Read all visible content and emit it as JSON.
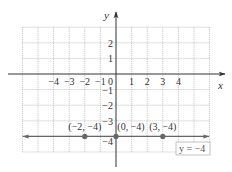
{
  "chart_data": {
    "type": "line",
    "title": "",
    "xlabel": "x",
    "ylabel": "y",
    "xlim": [
      -6,
      6
    ],
    "ylim": [
      -5,
      3
    ],
    "grid": true,
    "x_ticks": [
      "-4",
      "-3",
      "-2",
      "-1",
      "0",
      "1",
      "2",
      "3",
      "4"
    ],
    "y_ticks": [
      "2",
      "1",
      "-1",
      "-2",
      "-3",
      "-4"
    ],
    "series": [
      {
        "name": "y = -4",
        "type": "horizontal-line",
        "y": -4,
        "points": [
          {
            "x": -2,
            "y": -4,
            "label": "(−2, −4)"
          },
          {
            "x": 0,
            "y": -4,
            "label": "(0, −4)"
          },
          {
            "x": 3,
            "y": -4,
            "label": "(3, −4)"
          }
        ]
      }
    ],
    "annotations": [
      {
        "text": "y = −4",
        "boxed": true,
        "position": "bottom-right"
      }
    ]
  },
  "labels": {
    "x_axis": "x",
    "y_axis": "y",
    "origin": "0",
    "equation": "y = −4",
    "xticks": [
      {
        "v": -4,
        "t": "−4"
      },
      {
        "v": -3,
        "t": "−3"
      },
      {
        "v": -2,
        "t": "−2"
      },
      {
        "v": -1,
        "t": "−1"
      },
      {
        "v": 1,
        "t": "1"
      },
      {
        "v": 2,
        "t": "2"
      },
      {
        "v": 3,
        "t": "3"
      },
      {
        "v": 4,
        "t": "4"
      }
    ],
    "yticks": [
      {
        "v": 2,
        "t": "2"
      },
      {
        "v": 1,
        "t": "1"
      },
      {
        "v": -1,
        "t": "−1"
      },
      {
        "v": -2,
        "t": "−2"
      },
      {
        "v": -3,
        "t": "−3"
      },
      {
        "v": -4,
        "t": "−4"
      }
    ],
    "points": [
      {
        "x": -2,
        "y": -4,
        "t": "(−2, −4)"
      },
      {
        "x": 0,
        "y": -4,
        "t": "(0, −4)"
      },
      {
        "x": 3,
        "y": -4,
        "t": "(3, −4)"
      }
    ]
  },
  "colors": {
    "grid": "#9a9a9a",
    "axis": "#333333",
    "line": "#666666",
    "point": "#666666"
  }
}
